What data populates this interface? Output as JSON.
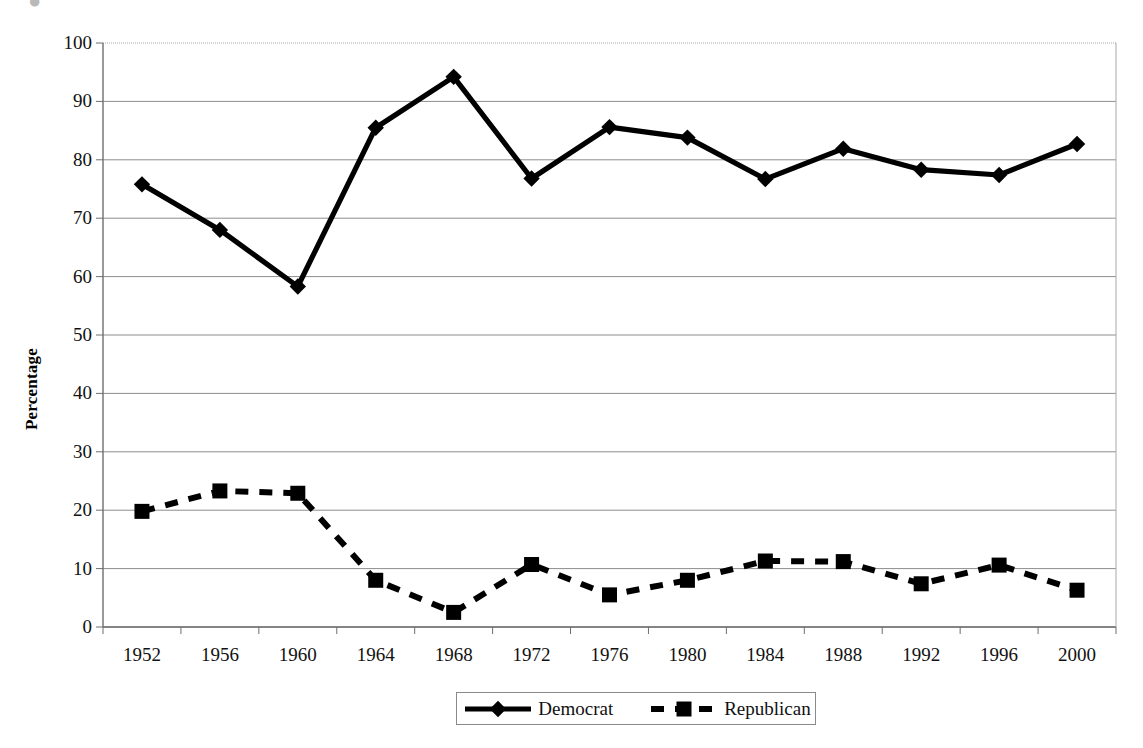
{
  "chart_data": {
    "type": "line",
    "title": "",
    "xlabel": "",
    "ylabel": "Percentage",
    "categories": [
      "1952",
      "1956",
      "1960",
      "1964",
      "1968",
      "1972",
      "1976",
      "1980",
      "1984",
      "1988",
      "1992",
      "1996",
      "2000"
    ],
    "ylim": [
      0,
      100
    ],
    "ytick_step": 10,
    "yticks": [
      "0",
      "10",
      "20",
      "30",
      "40",
      "50",
      "60",
      "70",
      "80",
      "90",
      "100"
    ],
    "grid": "horizontal",
    "legend_position": "bottom",
    "series": [
      {
        "name": "Democrat",
        "marker": "diamond",
        "line_style": "solid",
        "color": "#000000",
        "values": [
          75.8,
          68.0,
          58.3,
          85.5,
          94.2,
          76.8,
          85.6,
          83.8,
          76.7,
          81.9,
          78.3,
          77.4,
          82.7
        ]
      },
      {
        "name": "Republican",
        "marker": "square",
        "line_style": "dashed",
        "color": "#000000",
        "values": [
          19.8,
          23.3,
          22.9,
          8.0,
          2.5,
          10.7,
          5.5,
          8.0,
          11.3,
          11.2,
          7.4,
          10.6,
          6.3
        ]
      }
    ]
  },
  "axes": {
    "y_axis_label": "Percentage"
  },
  "legend": {
    "entries": [
      {
        "label": "Democrat",
        "icon": "solid-line-diamond-marker"
      },
      {
        "label": "Republican",
        "icon": "dashed-line-square-marker"
      }
    ]
  },
  "colors": {
    "series": "#000000",
    "gridline": "#8d8d8d",
    "axis": "#6e6e6e",
    "background": "#ffffff"
  },
  "page": {
    "top_artifact_glyph": "●"
  }
}
